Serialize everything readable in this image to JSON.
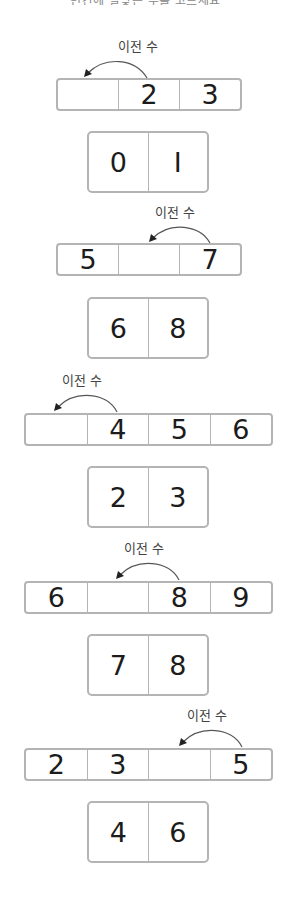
{
  "header": {
    "cropped_text": "빈칸에 알맞은 수를 고르세요"
  },
  "arrow_label": "이전 수",
  "puzzles": [
    {
      "row": [
        "",
        "2",
        "3"
      ],
      "blank_index": 0,
      "arrow_from": 1,
      "choices": [
        "0",
        "I"
      ]
    },
    {
      "row": [
        "5",
        "",
        "7"
      ],
      "blank_index": 1,
      "arrow_from": 2,
      "choices": [
        "6",
        "8"
      ]
    },
    {
      "row": [
        "",
        "4",
        "5",
        "6"
      ],
      "blank_index": 0,
      "arrow_from": 1,
      "choices": [
        "2",
        "3"
      ]
    },
    {
      "row": [
        "6",
        "",
        "8",
        "9"
      ],
      "blank_index": 1,
      "arrow_from": 2,
      "choices": [
        "7",
        "8"
      ]
    },
    {
      "row": [
        "2",
        "3",
        "",
        "5"
      ],
      "blank_index": 2,
      "arrow_from": 3,
      "choices": [
        "4",
        "6"
      ]
    }
  ],
  "colors": {
    "border": "#b4b4b4",
    "text": "#1c1c1c",
    "label": "#444444"
  }
}
